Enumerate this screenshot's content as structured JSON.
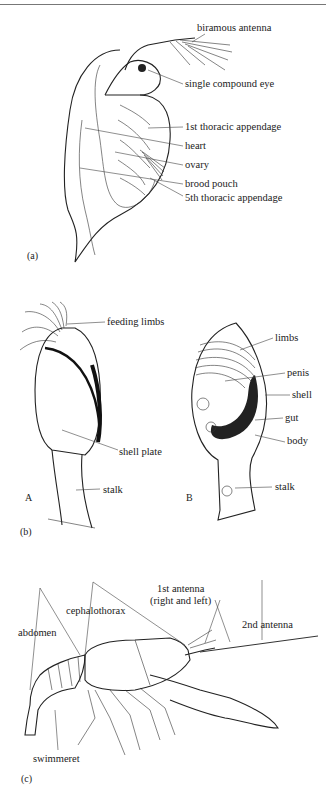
{
  "figure": {
    "panels": [
      {
        "id": "a",
        "tag": "(a)",
        "subject": "water flea (Daphnia)",
        "labels": [
          "biramous antenna",
          "single compound eye",
          "1st thoracic appendage",
          "heart",
          "ovary",
          "brood pouch",
          "5th thoracic appendage"
        ]
      },
      {
        "id": "b",
        "tag": "(b)",
        "subject": "goose barnacle",
        "views": [
          {
            "tag": "A",
            "labels": [
              "feeding limbs",
              "shell plate",
              "stalk"
            ]
          },
          {
            "tag": "B",
            "labels": [
              "limbs",
              "penis",
              "shell",
              "gut",
              "body",
              "stalk"
            ]
          }
        ]
      },
      {
        "id": "c",
        "tag": "(c)",
        "subject": "crayfish",
        "labels": [
          "1st antenna",
          "(right and left)",
          "cephalothorax",
          "2nd antenna",
          "abdomen",
          "swimmeret"
        ]
      }
    ]
  }
}
